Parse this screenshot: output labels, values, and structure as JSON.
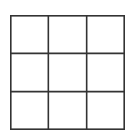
{
  "game": {
    "name": "tic-tac-toe board",
    "rows": 3,
    "cols": 3,
    "cells": [
      [
        "",
        "",
        ""
      ],
      [
        "",
        "",
        ""
      ],
      [
        "",
        "",
        ""
      ]
    ],
    "line_color": "#333333",
    "background_color": "#ffffff"
  }
}
